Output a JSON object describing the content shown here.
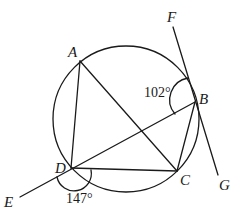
{
  "diagram": {
    "type": "geometry",
    "colors": {
      "stroke": "#1a1a1a",
      "background": "#ffffff"
    },
    "points": {
      "A": {
        "label": "A",
        "x": 80,
        "y": 61
      },
      "B": {
        "label": "B",
        "x": 195,
        "y": 102
      },
      "C": {
        "label": "C",
        "x": 177,
        "y": 171
      },
      "D": {
        "label": "D",
        "x": 71,
        "y": 168
      },
      "E": {
        "label": "E",
        "x": 20,
        "y": 197
      },
      "F": {
        "label": "F",
        "x": 173,
        "y": 27
      },
      "G": {
        "label": "G",
        "x": 218,
        "y": 175
      }
    },
    "circle": {
      "cx": 126,
      "cy": 119,
      "r": 73
    },
    "segments": [
      "AD",
      "AC",
      "DC",
      "BC",
      "DB",
      "DE",
      "FG"
    ],
    "angles": [
      {
        "name": "angle-FBD",
        "label": "102°",
        "vertex": "B",
        "between": [
          "F",
          "D"
        ]
      },
      {
        "name": "angle-EDC",
        "label": "147°",
        "vertex": "D",
        "between": [
          "E",
          "C"
        ]
      }
    ]
  }
}
